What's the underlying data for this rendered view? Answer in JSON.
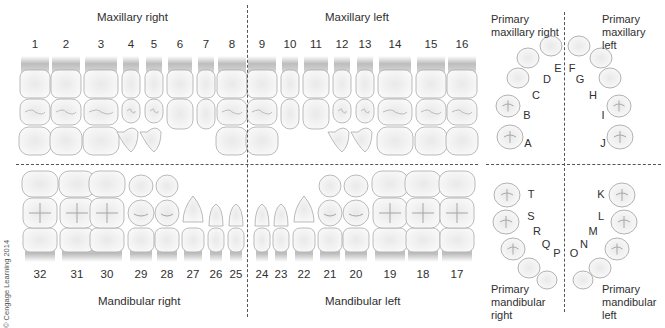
{
  "quadrant_labels": {
    "maxillary_right": "Maxillary right",
    "maxillary_left": "Maxillary left",
    "mandibular_right": "Mandibular right",
    "mandibular_left": "Mandibular left"
  },
  "permanent_upper": [
    {
      "num": "1",
      "x": 35,
      "w": 30
    },
    {
      "num": "2",
      "x": 66,
      "w": 30
    },
    {
      "num": "3",
      "x": 101,
      "w": 34
    },
    {
      "num": "4",
      "x": 131,
      "w": 18
    },
    {
      "num": "5",
      "x": 154,
      "w": 18
    },
    {
      "num": "6",
      "x": 180,
      "w": 26
    },
    {
      "num": "7",
      "x": 206,
      "w": 18
    },
    {
      "num": "8",
      "x": 232,
      "w": 30
    },
    {
      "num": "9",
      "x": 262,
      "w": 30
    },
    {
      "num": "10",
      "x": 290,
      "w": 18
    },
    {
      "num": "11",
      "x": 316,
      "w": 26
    },
    {
      "num": "12",
      "x": 342,
      "w": 18
    },
    {
      "num": "13",
      "x": 365,
      "w": 18
    },
    {
      "num": "14",
      "x": 395,
      "w": 34
    },
    {
      "num": "15",
      "x": 431,
      "w": 30
    },
    {
      "num": "16",
      "x": 462,
      "w": 30
    }
  ],
  "permanent_lower": [
    {
      "num": "32",
      "x": 40,
      "w": 34
    },
    {
      "num": "31",
      "x": 77,
      "w": 34
    },
    {
      "num": "30",
      "x": 107,
      "w": 34
    },
    {
      "num": "29",
      "x": 141,
      "w": 26
    },
    {
      "num": "28",
      "x": 167,
      "w": 24
    },
    {
      "num": "27",
      "x": 193,
      "w": 22
    },
    {
      "num": "26",
      "x": 216,
      "w": 16
    },
    {
      "num": "25",
      "x": 236,
      "w": 16
    },
    {
      "num": "24",
      "x": 262,
      "w": 16
    },
    {
      "num": "23",
      "x": 281,
      "w": 16
    },
    {
      "num": "22",
      "x": 304,
      "w": 22
    },
    {
      "num": "21",
      "x": 330,
      "w": 24
    },
    {
      "num": "20",
      "x": 356,
      "w": 26
    },
    {
      "num": "19",
      "x": 390,
      "w": 34
    },
    {
      "num": "18",
      "x": 423,
      "w": 34
    },
    {
      "num": "17",
      "x": 457,
      "w": 34
    }
  ],
  "primary_labels": {
    "maxillary_right": "Primary maxillary right",
    "maxillary_left": "Primary maxillary left",
    "mandibular_right": "Primary mandibular right",
    "mandibular_left": "Primary mandibular left"
  },
  "primary_upper": [
    {
      "letter": "A",
      "lx": 528,
      "ly": 143,
      "tx": 510,
      "ty": 137,
      "r": 12
    },
    {
      "letter": "B",
      "lx": 527,
      "ly": 115,
      "tx": 508,
      "ty": 106,
      "r": 11
    },
    {
      "letter": "C",
      "lx": 536,
      "ly": 95,
      "tx": 518,
      "ty": 78,
      "r": 10
    },
    {
      "letter": "D",
      "lx": 547,
      "ly": 79,
      "tx": 528,
      "ty": 58,
      "r": 10
    },
    {
      "letter": "E",
      "lx": 558,
      "ly": 68,
      "tx": 551,
      "ty": 46,
      "r": 10
    },
    {
      "letter": "F",
      "lx": 572,
      "ly": 68,
      "tx": 579,
      "ty": 46,
      "r": 10
    },
    {
      "letter": "G",
      "lx": 580,
      "ly": 79,
      "tx": 601,
      "ty": 58,
      "r": 10
    },
    {
      "letter": "H",
      "lx": 593,
      "ly": 95,
      "tx": 610,
      "ty": 78,
      "r": 10
    },
    {
      "letter": "I",
      "lx": 603,
      "ly": 115,
      "tx": 619,
      "ty": 106,
      "r": 11
    },
    {
      "letter": "J",
      "lx": 603,
      "ly": 143,
      "tx": 620,
      "ty": 137,
      "r": 12
    }
  ],
  "primary_lower": [
    {
      "letter": "T",
      "lx": 531,
      "ly": 194,
      "tx": 507,
      "ty": 195,
      "r": 12
    },
    {
      "letter": "S",
      "lx": 531,
      "ly": 216,
      "tx": 506,
      "ty": 222,
      "r": 12
    },
    {
      "letter": "R",
      "lx": 537,
      "ly": 231,
      "tx": 513,
      "ty": 249,
      "r": 11
    },
    {
      "letter": "Q",
      "lx": 546,
      "ly": 244,
      "tx": 529,
      "ty": 268,
      "r": 10
    },
    {
      "letter": "P",
      "lx": 557,
      "ly": 253,
      "tx": 547,
      "ty": 280,
      "r": 9
    },
    {
      "letter": "O",
      "lx": 574,
      "ly": 253,
      "tx": 583,
      "ty": 280,
      "r": 9
    },
    {
      "letter": "N",
      "lx": 584,
      "ly": 244,
      "tx": 600,
      "ty": 268,
      "r": 10
    },
    {
      "letter": "M",
      "lx": 593,
      "ly": 231,
      "tx": 617,
      "ty": 249,
      "r": 11
    },
    {
      "letter": "L",
      "lx": 601,
      "ly": 216,
      "tx": 624,
      "ty": 222,
      "r": 12
    },
    {
      "letter": "K",
      "lx": 601,
      "ly": 194,
      "tx": 622,
      "ty": 195,
      "r": 12
    }
  ],
  "copyright": "© Cengage Learning 2014",
  "colors": {
    "tooth_fill": "#f4f4f4",
    "tooth_stroke": "#a9a9a9",
    "root_shade": "#c9c9c9",
    "dash": "#555555",
    "text": "#2f2f2f"
  }
}
